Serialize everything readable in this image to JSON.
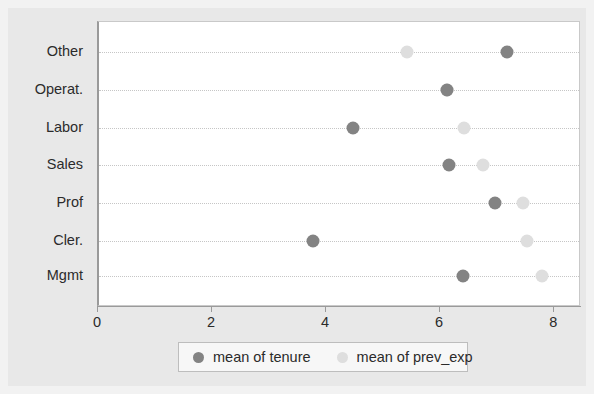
{
  "chart_data": {
    "type": "scatter",
    "title": "",
    "xlabel": "",
    "ylabel": "",
    "xlim": [
      0,
      8.47
    ],
    "xticks": [
      0,
      2,
      4,
      6,
      8
    ],
    "xticklabels": [
      "0",
      "2",
      "4",
      "6",
      "8"
    ],
    "categories": [
      "Other",
      "Operat.",
      "Labor",
      "Sales",
      "Prof",
      "Cler.",
      "Mgmt"
    ],
    "grid": "horizontal-dotted",
    "legend_position": "bottom",
    "series": [
      {
        "name": "mean of tenure",
        "color": "#838383",
        "values": [
          7.16,
          6.1,
          4.46,
          6.14,
          6.95,
          3.75,
          6.39
        ]
      },
      {
        "name": "mean of prev_exp",
        "color": "#dedede",
        "values": [
          5.4,
          6.1,
          6.4,
          6.74,
          7.44,
          7.51,
          7.77
        ]
      }
    ]
  },
  "legend": {
    "entries": [
      {
        "label": "mean of tenure",
        "marker": "filled-circle-dark"
      },
      {
        "label": "mean of prev_exp",
        "marker": "filled-circle-light"
      }
    ]
  },
  "colors": {
    "figure_background": "#e8e8e8",
    "plot_background": "#ffffff",
    "outer_border": "#f2f2f2",
    "axis": "#9a9a9a",
    "gridline": "#c6c6c6",
    "tenure": "#838383",
    "prev_exp": "#dedede",
    "text": "#2b2b2b"
  }
}
